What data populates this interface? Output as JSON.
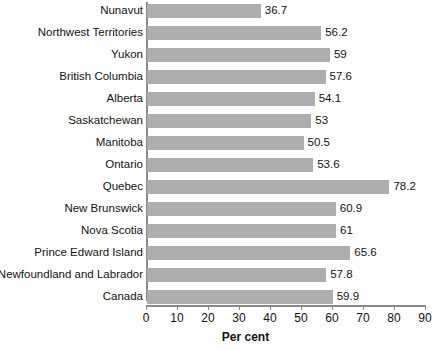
{
  "chart_data": {
    "type": "bar",
    "orientation": "horizontal",
    "title": "",
    "xlabel": "Per cent",
    "ylabel": "",
    "xlim": [
      0,
      90
    ],
    "xticks": [
      0,
      10,
      20,
      30,
      40,
      50,
      60,
      70,
      80,
      90
    ],
    "grid": false,
    "legend": null,
    "bar_color": "#adadad",
    "axis_color": "#8a8a8a",
    "categories": [
      "Nunavut",
      "Northwest Territories",
      "Yukon",
      "British Columbia",
      "Alberta",
      "Saskatchewan",
      "Manitoba",
      "Ontario",
      "Quebec",
      "New Brunswick",
      "Nova Scotia",
      "Prince Edward Island",
      "Newfoundland and Labrador",
      "Canada"
    ],
    "values": [
      36.7,
      56.2,
      59,
      57.6,
      54.1,
      53,
      50.5,
      53.6,
      78.2,
      60.9,
      61,
      65.6,
      57.8,
      59.9
    ],
    "value_labels": [
      "36.7",
      "56.2",
      "59",
      "57.6",
      "54.1",
      "53",
      "50.5",
      "53.6",
      "78.2",
      "60.9",
      "61",
      "65.6",
      "57.8",
      "59.9"
    ]
  }
}
